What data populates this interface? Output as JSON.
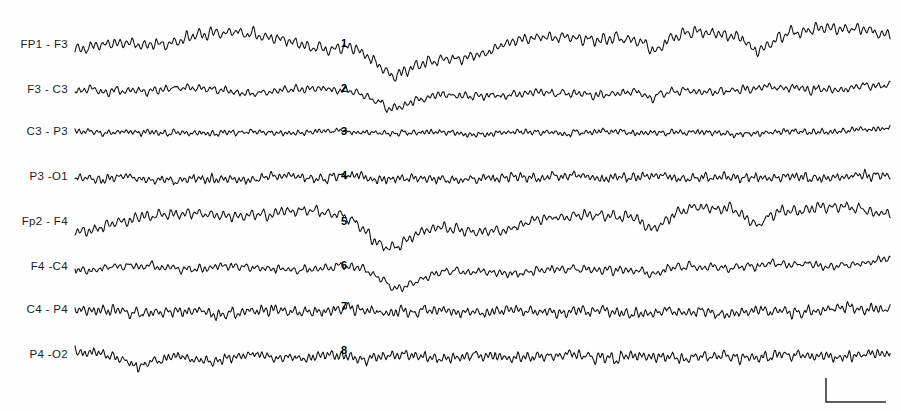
{
  "figure": {
    "kind": "eeg-polygraph-strip",
    "width": 901,
    "height": 411,
    "background_color": "#fefefe",
    "trace_color": "#0d0d0d",
    "label_color": "#1c1c1c",
    "trace_x_start": 75,
    "trace_x_end": 891
  },
  "chart_data": {
    "type": "line",
    "title": "",
    "subtitle": "",
    "xlabel": "",
    "ylabel": "",
    "grid": false,
    "legend_position": "left-labels",
    "x_units": "time (seconds)",
    "y_units": "amplitude (microvolts)",
    "x": [
      0,
      10
    ],
    "channel_labels": [
      "FP1 - F3",
      "F3 - C3",
      "C3 - P3",
      "P3 -O1",
      "Fp2 - F4",
      "F4 -C4",
      "C4 - P4",
      "P4 -O2"
    ],
    "series": [
      {
        "name": "FP1 - F3",
        "baseline_y": 45,
        "amplitude": 7.5,
        "noise_scale": 2.4,
        "fast_hz": 13.5,
        "slow_hz": 0.55,
        "slow_amp": 6.5,
        "seed": 101,
        "events": [
          {
            "center_x": 402,
            "depth": 33,
            "width": 34,
            "sharp": 0.72
          },
          {
            "center_x": 660,
            "depth": 14,
            "width": 18,
            "sharp": 0.8
          },
          {
            "center_x": 762,
            "depth": 13,
            "width": 16,
            "sharp": 0.82
          }
        ],
        "drift": [
          {
            "x": 75,
            "dy": 6
          },
          {
            "x": 140,
            "dy": -2
          },
          {
            "x": 205,
            "dy": -12
          },
          {
            "x": 270,
            "dy": -6
          },
          {
            "x": 330,
            "dy": 0
          },
          {
            "x": 380,
            "dy": -3
          },
          {
            "x": 460,
            "dy": 8
          },
          {
            "x": 540,
            "dy": -4
          },
          {
            "x": 620,
            "dy": -10
          },
          {
            "x": 700,
            "dy": -9
          },
          {
            "x": 790,
            "dy": -14
          },
          {
            "x": 860,
            "dy": -13
          },
          {
            "x": 891,
            "dy": -12
          }
        ]
      },
      {
        "name": "F3 - C3",
        "baseline_y": 90,
        "amplitude": 5.0,
        "noise_scale": 2.1,
        "fast_hz": 15.0,
        "slow_hz": 0.7,
        "slow_amp": 3.0,
        "seed": 202,
        "events": [
          {
            "center_x": 400,
            "depth": 14,
            "width": 26,
            "sharp": 0.6
          },
          {
            "center_x": 655,
            "depth": 6,
            "width": 14,
            "sharp": 0.75
          }
        ],
        "drift": [
          {
            "x": 75,
            "dy": 2
          },
          {
            "x": 160,
            "dy": -1
          },
          {
            "x": 250,
            "dy": 1
          },
          {
            "x": 340,
            "dy": 0
          },
          {
            "x": 430,
            "dy": 5
          },
          {
            "x": 520,
            "dy": 4
          },
          {
            "x": 620,
            "dy": 2
          },
          {
            "x": 720,
            "dy": 0
          },
          {
            "x": 820,
            "dy": -2
          },
          {
            "x": 891,
            "dy": -4
          }
        ]
      },
      {
        "name": "C3 - P3",
        "baseline_y": 132,
        "amplitude": 3.4,
        "noise_scale": 1.5,
        "fast_hz": 19.0,
        "slow_hz": 0.9,
        "slow_amp": 1.6,
        "seed": 303,
        "events": [],
        "drift": [
          {
            "x": 75,
            "dy": 0
          },
          {
            "x": 200,
            "dy": 1
          },
          {
            "x": 330,
            "dy": 0
          },
          {
            "x": 470,
            "dy": 1
          },
          {
            "x": 600,
            "dy": 0
          },
          {
            "x": 740,
            "dy": 1
          },
          {
            "x": 891,
            "dy": -2
          }
        ]
      },
      {
        "name": "P3 -O1",
        "baseline_y": 177,
        "amplitude": 5.2,
        "noise_scale": 2.3,
        "fast_hz": 18.0,
        "slow_hz": 1.1,
        "slow_amp": 2.0,
        "seed": 404,
        "events": [],
        "drift": [
          {
            "x": 75,
            "dy": 1
          },
          {
            "x": 180,
            "dy": 3
          },
          {
            "x": 300,
            "dy": 0
          },
          {
            "x": 420,
            "dy": 2
          },
          {
            "x": 560,
            "dy": 0
          },
          {
            "x": 700,
            "dy": 1
          },
          {
            "x": 840,
            "dy": 0
          },
          {
            "x": 891,
            "dy": -1
          }
        ]
      },
      {
        "name": "Fp2 - F4",
        "baseline_y": 222,
        "amplitude": 6.8,
        "noise_scale": 2.3,
        "fast_hz": 14.0,
        "slow_hz": 0.6,
        "slow_amp": 5.5,
        "seed": 505,
        "events": [
          {
            "center_x": 398,
            "depth": 31,
            "width": 33,
            "sharp": 0.75
          },
          {
            "center_x": 658,
            "depth": 12,
            "width": 17,
            "sharp": 0.8
          },
          {
            "center_x": 760,
            "depth": 11,
            "width": 16,
            "sharp": 0.8
          }
        ],
        "drift": [
          {
            "x": 75,
            "dy": 7
          },
          {
            "x": 140,
            "dy": -3
          },
          {
            "x": 210,
            "dy": -9
          },
          {
            "x": 280,
            "dy": -7
          },
          {
            "x": 340,
            "dy": -10
          },
          {
            "x": 380,
            "dy": -8
          },
          {
            "x": 470,
            "dy": 9
          },
          {
            "x": 550,
            "dy": -2
          },
          {
            "x": 630,
            "dy": -9
          },
          {
            "x": 710,
            "dy": -11
          },
          {
            "x": 790,
            "dy": -13
          },
          {
            "x": 860,
            "dy": -11
          },
          {
            "x": 891,
            "dy": -9
          }
        ]
      },
      {
        "name": "F4 -C4",
        "baseline_y": 267,
        "amplitude": 5.2,
        "noise_scale": 2.0,
        "fast_hz": 15.5,
        "slow_hz": 0.75,
        "slow_amp": 3.2,
        "seed": 606,
        "events": [
          {
            "center_x": 400,
            "depth": 15,
            "width": 25,
            "sharp": 0.62
          },
          {
            "center_x": 657,
            "depth": 7,
            "width": 14,
            "sharp": 0.75
          }
        ],
        "drift": [
          {
            "x": 75,
            "dy": 2
          },
          {
            "x": 170,
            "dy": 0
          },
          {
            "x": 260,
            "dy": 1
          },
          {
            "x": 350,
            "dy": 1
          },
          {
            "x": 440,
            "dy": 6
          },
          {
            "x": 530,
            "dy": 4
          },
          {
            "x": 630,
            "dy": 1
          },
          {
            "x": 730,
            "dy": -1
          },
          {
            "x": 830,
            "dy": -3
          },
          {
            "x": 891,
            "dy": -5
          }
        ]
      },
      {
        "name": "C4 - P4",
        "baseline_y": 310,
        "amplitude": 6.2,
        "noise_scale": 2.6,
        "fast_hz": 17.0,
        "slow_hz": 1.0,
        "slow_amp": 2.4,
        "seed": 707,
        "events": [],
        "drift": [
          {
            "x": 75,
            "dy": 1
          },
          {
            "x": 190,
            "dy": 2
          },
          {
            "x": 310,
            "dy": 0
          },
          {
            "x": 430,
            "dy": 1
          },
          {
            "x": 570,
            "dy": 2
          },
          {
            "x": 700,
            "dy": 3
          },
          {
            "x": 830,
            "dy": 0
          },
          {
            "x": 891,
            "dy": -2
          }
        ]
      },
      {
        "name": "P4 -O2",
        "baseline_y": 355,
        "amplitude": 6.0,
        "noise_scale": 2.5,
        "fast_hz": 17.5,
        "slow_hz": 1.05,
        "slow_amp": 2.6,
        "seed": 808,
        "events": [
          {
            "center_x": 140,
            "depth": 8,
            "width": 14,
            "sharp": 0.7
          }
        ],
        "drift": [
          {
            "x": 75,
            "dy": -2
          },
          {
            "x": 180,
            "dy": 4
          },
          {
            "x": 300,
            "dy": 1
          },
          {
            "x": 420,
            "dy": 2
          },
          {
            "x": 560,
            "dy": 1
          },
          {
            "x": 690,
            "dy": 2
          },
          {
            "x": 820,
            "dy": 1
          },
          {
            "x": 891,
            "dy": 0
          }
        ]
      }
    ],
    "annotations": [
      {
        "label": "1",
        "x": 344,
        "y": 43
      },
      {
        "label": "2",
        "x": 344,
        "y": 88
      },
      {
        "label": "3",
        "x": 344,
        "y": 131
      },
      {
        "label": "4",
        "x": 344,
        "y": 175
      },
      {
        "label": "5",
        "x": 344,
        "y": 221
      },
      {
        "label": "6",
        "x": 344,
        "y": 265
      },
      {
        "label": "7",
        "x": 344,
        "y": 306
      },
      {
        "label": "8",
        "x": 344,
        "y": 350
      }
    ]
  },
  "labels": {
    "x_right": 68,
    "items": [
      {
        "text": "FP1 - F3",
        "y": 45
      },
      {
        "text": "F3 - C3",
        "y": 90
      },
      {
        "text": "C3 - P3",
        "y": 132
      },
      {
        "text": "P3 -O1",
        "y": 177
      },
      {
        "text": "Fp2 - F4",
        "y": 222
      },
      {
        "text": "F4 -C4",
        "y": 267
      },
      {
        "text": "C4 - P4",
        "y": 310
      },
      {
        "text": "P4 -O2",
        "y": 355
      }
    ]
  },
  "calibration": {
    "name": "calibration-marker",
    "vertical_x": 826,
    "vertical_y_top": 378,
    "vertical_y_bottom": 402,
    "horizontal_x_end": 886,
    "label": "",
    "color": "#2a2a2a"
  }
}
